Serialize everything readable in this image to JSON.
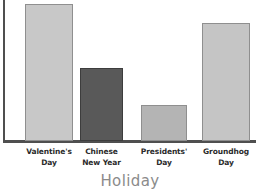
{
  "chart_data": {
    "type": "bar",
    "title": "",
    "subtitle": "",
    "xlabel": "Holiday",
    "ylabel": "",
    "categories": [
      "Valentine's Day",
      "Chinese New Year",
      "Presidents' Day",
      "Groundhog Day"
    ],
    "category_lines": [
      [
        "Valentine's",
        "Day"
      ],
      [
        "Chinese",
        "New Year"
      ],
      [
        "Presidents'",
        "Day"
      ],
      [
        "Groundhog",
        "Day"
      ]
    ],
    "values": [
      100,
      53,
      26,
      86
    ],
    "ylim": [
      0,
      100
    ],
    "grid": false,
    "legend": null,
    "tick_labels_y": [],
    "annotations": [],
    "series": [
      {
        "name": "Holiday",
        "values": [
          100,
          53,
          26,
          86
        ]
      }
    ],
    "bar_colors": [
      "#c8c8c8",
      "#595959",
      "#b4b4b4",
      "#c5c5c5"
    ],
    "bar_edge_colors": [
      "#8f8f8f",
      "#3d3d3d",
      "#8f8f8f",
      "#8f8f8f"
    ]
  },
  "style": {
    "axis_color": "#4f4f4f",
    "axis_title_color": "#8b8b8b",
    "tick_label_color": "#2b2b2b",
    "background": "#ffffff"
  }
}
